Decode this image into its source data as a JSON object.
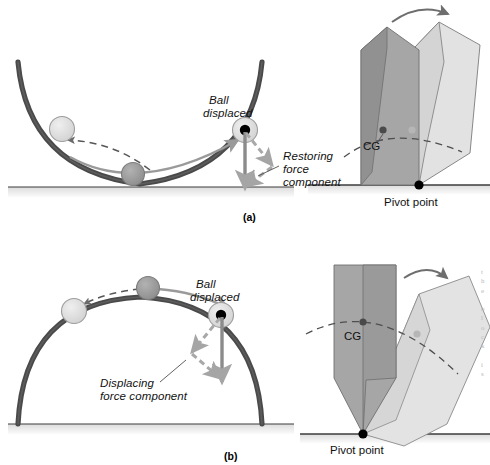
{
  "figure": {
    "panels": [
      {
        "tag": "(a)",
        "tag_x": 243,
        "tag_y": 211,
        "description": "Stable equilibrium — ball in a bowl; block with low CG tips back",
        "labels": {
          "ball_displaced_line1": "Ball",
          "ball_displaced_line2": "displaced",
          "force_line1": "Restoring",
          "force_line2": "force",
          "force_line3": "component",
          "cg": "CG",
          "pivot": "Pivot point"
        }
      },
      {
        "tag": "(b)",
        "tag_x": 224,
        "tag_y": 450,
        "description": "Unstable equilibrium — ball on a dome; block with high CG tips over",
        "labels": {
          "ball_displaced_line1": "Ball",
          "ball_displaced_line2": "displaced",
          "force_line1": "Displacing",
          "force_line2": "force component",
          "cg": "CG",
          "pivot": "Pivot point"
        }
      }
    ],
    "colors": {
      "curve": "#4a4a4a",
      "ground_line": "#3c3c3c",
      "ground_band": "#e3e3e3",
      "ball_light": "#dcdcdc",
      "ball_medium": "#9b9b9b",
      "ball_outline": "#8c8c8c",
      "dot_black": "#000000",
      "arrow_gray": "#9a9a9a",
      "arrow_dark": "#7d7d7d",
      "block_dark": "#a3a3a3",
      "block_dark_side": "#8e8e8e",
      "block_light": "#dedede",
      "block_light_side": "#cfcfcf",
      "block_outline": "#6f6f6f",
      "dashed": "#4f4f4f",
      "text": "#111111"
    }
  },
  "margin_notes": {
    "right_edge_fragments": [
      "t",
      "h",
      "e",
      "",
      "b",
      "l",
      "o",
      "c",
      "k",
      "",
      "i",
      "s"
    ]
  }
}
